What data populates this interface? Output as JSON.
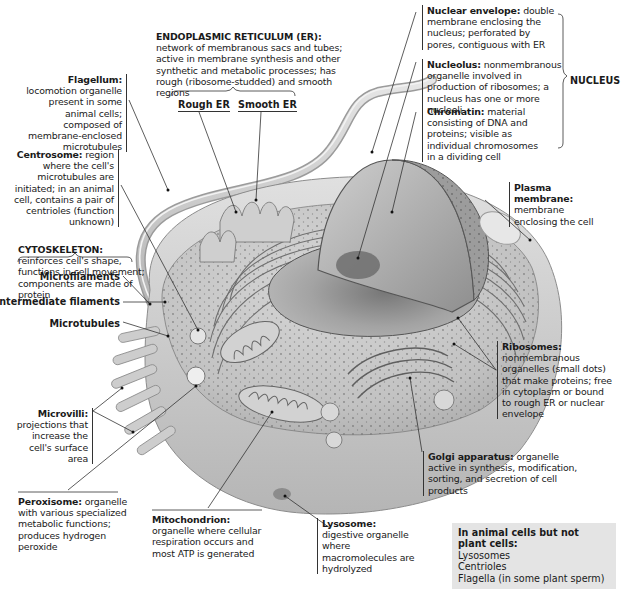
{
  "figure": {
    "subject": "Animal cell",
    "er": {
      "title": "ENDOPLASMIC RETICULUM (ER):",
      "desc": "network of membranous sacs and tubes; active in membrane synthesis and other synthetic and metabolic processes; has rough (ribosome-studded) and smooth regions",
      "rough": "Rough ER",
      "smooth": "Smooth ER"
    },
    "nucleus": {
      "group_label": "NUCLEUS",
      "envelope": {
        "title": "Nuclear envelope:",
        "desc": "double membrane enclosing the nucleus; perforated by pores, contiguous with ER"
      },
      "nucleolus": {
        "title": "Nucleolus:",
        "desc": "nonmembranous organelle involved in production of ribosomes; a nucleus has one or more nucleoli"
      },
      "chromatin": {
        "title": "Chromatin:",
        "desc": "material consisting of DNA and proteins; visible as individual chromosomes in a dividing cell"
      }
    },
    "flagellum": {
      "title": "Flagellum:",
      "desc": "locomotion organelle present in some animal cells; composed of membrane-enclosed microtubules"
    },
    "centrosome": {
      "title": "Centrosome:",
      "desc": "region where the cell's microtubules are initiated; in an animal cell, contains a pair of centrioles (function unknown)"
    },
    "cytoskeleton": {
      "title": "CYTOSKELETON:",
      "desc": "reinforces cell's shape, functions in cell movement; components are made of protein",
      "components": [
        "Microfilaments",
        "Intermediate filaments",
        "Microtubules"
      ]
    },
    "microvilli": {
      "title": "Microvilli:",
      "desc": "projections that increase the cell's surface area"
    },
    "peroxisome": {
      "title": "Peroxisome:",
      "desc": "organelle with various specialized metabolic functions; produces hydrogen peroxide"
    },
    "mitochondrion": {
      "title": "Mitochondrion:",
      "desc": "organelle where cellular respiration occurs and most ATP is generated"
    },
    "lysosome": {
      "title": "Lysosome:",
      "desc": "digestive organelle where macromolecules are hydrolyzed"
    },
    "plasma_membrane": {
      "title": "Plasma membrane:",
      "desc": "membrane enclosing the cell"
    },
    "ribosomes": {
      "title": "Ribosomes:",
      "desc": "nonmembranous organelles (small dots) that make proteins; free in cytoplasm or bound to rough ER or nuclear envelope"
    },
    "golgi": {
      "title": "Golgi apparatus:",
      "desc": "organelle active in synthesis, modification, sorting, and secretion of cell products"
    },
    "note": {
      "heading": "In animal cells but not plant cells:",
      "items": [
        "Lysosomes",
        "Centrioles",
        "Flagella (in some plant sperm)"
      ]
    },
    "colors": {
      "cell_fill": "#c9c9c9",
      "cell_dark": "#9a9a9a",
      "note_bg": "#e4e4e4",
      "leader": "#333333"
    }
  }
}
